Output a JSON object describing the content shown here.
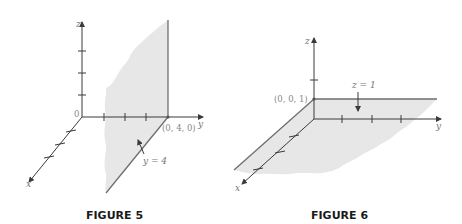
{
  "figures": [
    {
      "caption": "FIGURE 5",
      "axes": {
        "x": "x",
        "y": "y",
        "z": "z",
        "origin": "0"
      },
      "point_label": "(0, 4, 0)",
      "plane_label": "y = 4"
    },
    {
      "caption": "FIGURE 6",
      "axes": {
        "x": "x",
        "y": "y",
        "z": "z"
      },
      "point_label": "(0, 0, 1)",
      "plane_label": "z = 1"
    }
  ],
  "colors": {
    "plane_fill": "#e7e7e7",
    "axis": "#3a3a3a",
    "label": "#777777",
    "caption": "#1a1a1a"
  }
}
